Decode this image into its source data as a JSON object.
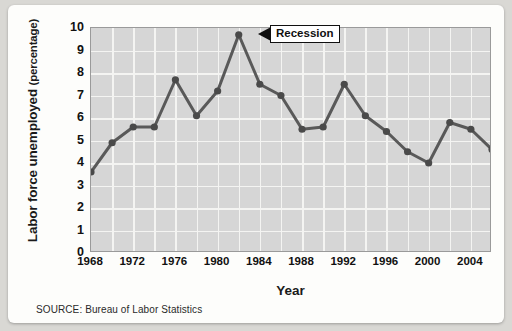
{
  "chart_data": {
    "type": "line",
    "title": "",
    "xlabel": "Year",
    "ylabel": "Labor force unemployed (percentage)",
    "ylabel_main": "Labor force unemployed",
    "ylabel_paren": "(percentage)",
    "ylim": [
      0,
      10
    ],
    "xlim": [
      1968,
      2006
    ],
    "grid": true,
    "legend": false,
    "ytick_labels": [
      "10",
      "9",
      "8",
      "7",
      "6",
      "5",
      "4",
      "3",
      "2",
      "1",
      "0"
    ],
    "ytick_values": [
      10,
      9,
      8,
      7,
      6,
      5,
      4,
      3,
      2,
      1,
      0
    ],
    "xtick_labels": [
      "1968",
      "1972",
      "1976",
      "1980",
      "1984",
      "1988",
      "1992",
      "1996",
      "2000",
      "2004"
    ],
    "xtick_values": [
      1968,
      1972,
      1976,
      1980,
      1984,
      1988,
      1992,
      1996,
      2000,
      2004
    ],
    "x": [
      1968,
      1970,
      1972,
      1974,
      1976,
      1978,
      1980,
      1982,
      1984,
      1986,
      1988,
      1990,
      1992,
      1994,
      1996,
      1998,
      2000,
      2002,
      2004,
      2006
    ],
    "values": [
      3.6,
      4.9,
      5.6,
      5.6,
      7.7,
      6.1,
      7.2,
      9.7,
      7.5,
      7.0,
      5.5,
      5.6,
      7.5,
      6.1,
      5.4,
      4.5,
      4.0,
      5.8,
      5.5,
      4.6
    ],
    "series": [
      {
        "name": "Labor force unemployed",
        "values": [
          3.6,
          4.9,
          5.6,
          5.6,
          7.7,
          6.1,
          7.2,
          9.7,
          7.5,
          7.0,
          5.5,
          5.6,
          7.5,
          6.1,
          5.4,
          4.5,
          4.0,
          5.8,
          5.5,
          4.6
        ]
      }
    ],
    "annotations": [
      {
        "label": "Recession",
        "x": 1982,
        "y": 9.7
      }
    ],
    "line_color": "#595959",
    "marker_color": "#4a4a4a",
    "plot_bg": "#d6d6d6",
    "grid_color": "#f4f4f2"
  },
  "source": {
    "text": "SOURCE: Bureau of Labor Statistics"
  },
  "callout": {
    "label": "Recession"
  }
}
